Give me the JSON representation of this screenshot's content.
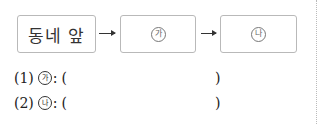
{
  "flow": {
    "boxes": [
      {
        "label": "동네 앞"
      },
      {
        "label": "가"
      },
      {
        "label": "나"
      }
    ],
    "arrow_glyph": "→"
  },
  "questions": [
    {
      "number": "(1)",
      "marker": "가",
      "colon": ":",
      "open": "(",
      "close": ")"
    },
    {
      "number": "(2)",
      "marker": "나",
      "colon": ":",
      "open": "(",
      "close": ")"
    }
  ]
}
